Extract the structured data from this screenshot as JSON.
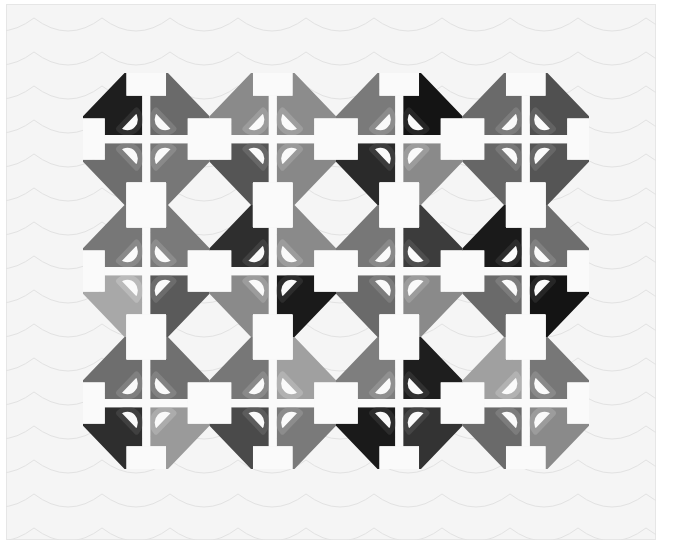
{
  "image": {
    "subject": "Quilt photograph (grayscale)",
    "description": "Twelve appliqué-style flower blocks arranged 3 rows by 4 columns, each with four gray-toned quadrants, white half-disc petals with fabric rings, white center cross, and white setting squares and diamonds, inside a white quilted border",
    "layout": {
      "rows": 3,
      "cols": 4
    },
    "colors": {
      "border": "#f5f5f5",
      "white_piece": "#fafafa",
      "quilting_line": "#e2e2e2",
      "background": "#ffffff"
    },
    "blocks": [
      [
        {
          "tl": "#1e1e1e",
          "tr": "#6a6a6a",
          "bl": "#6e6e6e",
          "br": "#777777"
        },
        {
          "tl": "#8a8a8a",
          "tr": "#8c8c8c",
          "bl": "#555555",
          "br": "#888888"
        },
        {
          "tl": "#7a7a7a",
          "tr": "#141414",
          "bl": "#2a2a2a",
          "br": "#8a8a8a"
        },
        {
          "tl": "#6a6a6a",
          "tr": "#505050",
          "bl": "#666666",
          "br": "#555555"
        }
      ],
      [
        {
          "tl": "#777777",
          "tr": "#7a7a7a",
          "bl": "#a8a8a8",
          "br": "#5a5a5a"
        },
        {
          "tl": "#2e2e2e",
          "tr": "#8a8a8a",
          "bl": "#8a8a8a",
          "br": "#1a1a1a"
        },
        {
          "tl": "#777777",
          "tr": "#3c3c3c",
          "bl": "#6a6a6a",
          "br": "#8a8a8a"
        },
        {
          "tl": "#1a1a1a",
          "tr": "#6e6e6e",
          "bl": "#6a6a6a",
          "br": "#141414"
        }
      ],
      [
        {
          "tl": "#6e6e6e",
          "tr": "#707070",
          "bl": "#2e2e2e",
          "br": "#9a9a9a"
        },
        {
          "tl": "#777777",
          "tr": "#a0a0a0",
          "bl": "#4a4a4a",
          "br": "#7a7a7a"
        },
        {
          "tl": "#7e7e7e",
          "tr": "#1e1e1e",
          "bl": "#1a1a1a",
          "br": "#333333"
        },
        {
          "tl": "#a0a0a0",
          "tr": "#777777",
          "bl": "#6a6a6a",
          "br": "#8a8a8a"
        }
      ]
    ]
  }
}
